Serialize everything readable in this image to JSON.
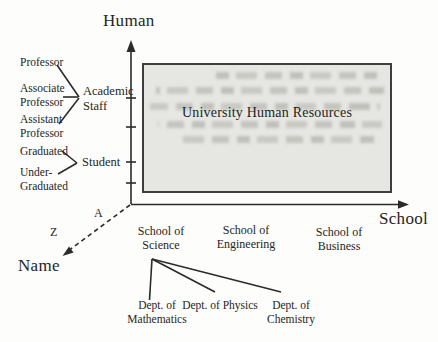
{
  "axes": {
    "human": "Human",
    "school": "School",
    "name": "Name",
    "a_marker": "A",
    "z_marker": "Z"
  },
  "box": {
    "title": "University Human Resources"
  },
  "human_groups": {
    "academic": {
      "label": "Academic Staff",
      "items": [
        "Professor",
        "Associate Professor",
        "Assistant Professor"
      ]
    },
    "student": {
      "label": "Student",
      "items": [
        "Graduated",
        "Under-Graduated"
      ]
    }
  },
  "schools": [
    "School of Science",
    "School of Engineering",
    "School of Business"
  ],
  "departments": [
    "Dept. of Mathematics",
    "Dept. of Physics",
    "Dept. of Chemistry"
  ],
  "colors": {
    "ink": "#2b2b2b",
    "box_fill": "#e6e6e2",
    "box_border": "#3e3e3e"
  }
}
